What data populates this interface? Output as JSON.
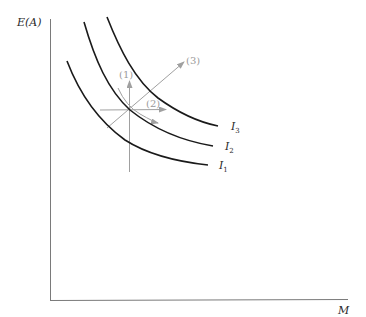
{
  "axes": {
    "y_label": "E(A)",
    "x_label": "M",
    "axis_color": "#7a7a7a"
  },
  "curves": [
    {
      "name": "I",
      "subscript": "1",
      "color": "#1a1a1a"
    },
    {
      "name": "I",
      "subscript": "2",
      "color": "#1a1a1a"
    },
    {
      "name": "I",
      "subscript": "3",
      "color": "#1a1a1a"
    }
  ],
  "arrows": [
    {
      "label": "(1)",
      "direction": "up"
    },
    {
      "label": "(2)",
      "direction": "right"
    },
    {
      "label": "(3)",
      "direction": "up-right"
    }
  ],
  "arrow_color": "#a0a0a0"
}
